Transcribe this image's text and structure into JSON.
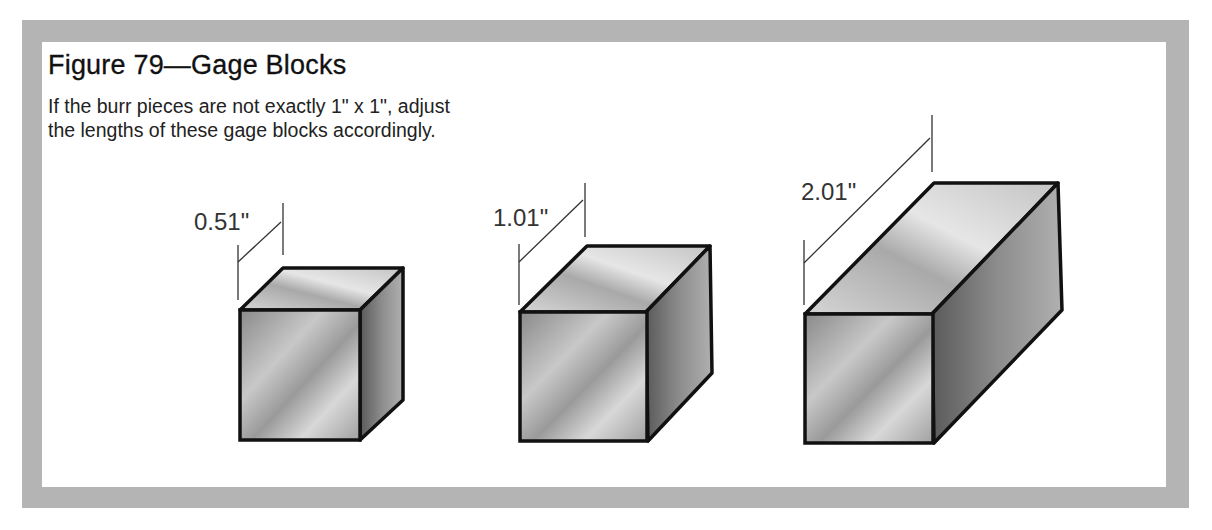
{
  "figure": {
    "title": "Figure 79—Gage Blocks",
    "caption_line1": "If the burr pieces are not exactly 1\" x 1\", adjust",
    "caption_line2": "the lengths of these gage blocks accordingly."
  },
  "blocks": [
    {
      "label": "0.51\"",
      "length_in": 0.51
    },
    {
      "label": "1.01\"",
      "length_in": 1.01
    },
    {
      "label": "2.01\"",
      "length_in": 2.01
    }
  ],
  "colors": {
    "frame": "#b4b4b4",
    "background": "#ffffff",
    "outline": "#111111"
  }
}
